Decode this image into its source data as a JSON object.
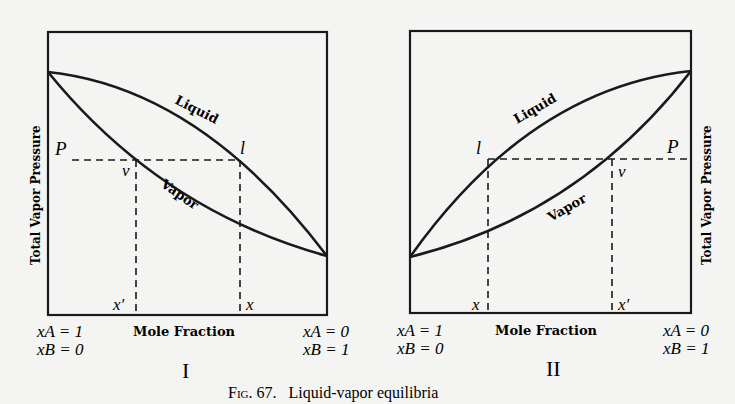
{
  "caption": {
    "fig_label": "Fig. 67.",
    "text": "Liquid-vapor equilibria"
  },
  "panels": [
    {
      "roman": "I",
      "ylabel": "Total Vapor Pressure",
      "ylabel_side": "left",
      "xlabel": "Mole Fraction",
      "left_label": {
        "line1": "xA = 1",
        "line2": "xB = 0"
      },
      "right_label": {
        "line1": "xA = 0",
        "line2": "xB = 1"
      },
      "curve_labels": {
        "liquid": "Liquid",
        "vapor": "Vapor"
      },
      "point_labels": {
        "P": "P",
        "l": "l",
        "v": "v",
        "x": "x",
        "x_prime": "x′"
      }
    },
    {
      "roman": "II",
      "ylabel": "Total Vapor Pressure",
      "ylabel_side": "right",
      "xlabel": "Mole Fraction",
      "left_label": {
        "line1": "xA = 1",
        "line2": "xB = 0"
      },
      "right_label": {
        "line1": "xA = 0",
        "line2": "xB = 1"
      },
      "curve_labels": {
        "liquid": "Liquid",
        "vapor": "Vapor"
      },
      "point_labels": {
        "P": "P",
        "l": "l",
        "v": "v",
        "x": "x",
        "x_prime": "x′"
      }
    }
  ],
  "colors": {
    "ink": "#1a1a1a",
    "paper": "#f4f4f2"
  }
}
